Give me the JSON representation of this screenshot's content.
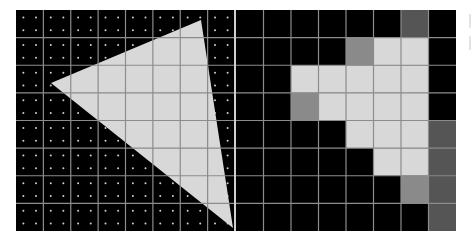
{
  "figure": {
    "grid": {
      "cols": 8,
      "rows": 8,
      "samples_per_cell": [
        2,
        2
      ]
    },
    "colors": {
      "background": "#000000",
      "grid_line": "#8c8c8c",
      "sample_dot": "#d0d0d0",
      "triangle_fill": "#d8d8d8",
      "coverage_full": "#d8d8d8",
      "coverage_half": "#8a8a8a",
      "coverage_quarter": "#555555",
      "coverage_none": "#000000"
    },
    "left_panel": {
      "label": "continuous-triangle-with-samples",
      "triangle_vertices": [
        [
          35,
          73
        ],
        [
          185,
          10
        ],
        [
          217,
          218
        ]
      ]
    },
    "right_panel": {
      "label": "rasterized-coverage",
      "coverage": [
        [
          0,
          0,
          0,
          0,
          0,
          0,
          1,
          0
        ],
        [
          0,
          0,
          0,
          0,
          2,
          3,
          3,
          0
        ],
        [
          0,
          0,
          3,
          3,
          3,
          3,
          3,
          0
        ],
        [
          0,
          0,
          2,
          3,
          3,
          3,
          3,
          0
        ],
        [
          0,
          0,
          0,
          0,
          3,
          3,
          3,
          1
        ],
        [
          0,
          0,
          0,
          0,
          0,
          3,
          3,
          1
        ],
        [
          0,
          0,
          0,
          0,
          0,
          0,
          2,
          1
        ],
        [
          0,
          0,
          0,
          0,
          0,
          0,
          0,
          1
        ]
      ]
    }
  }
}
